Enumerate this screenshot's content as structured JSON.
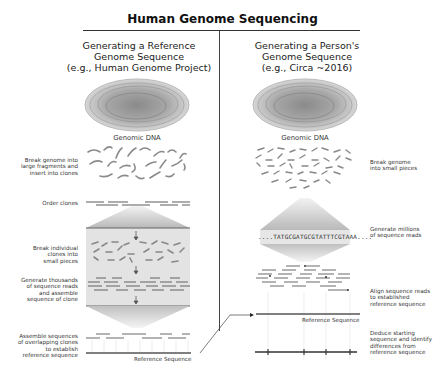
{
  "title": "Human Genome Sequencing",
  "left": {
    "heading": [
      "Generating a Reference",
      "Genome Sequence",
      "(e.g., Human Genome Project)"
    ],
    "dna_label": "Genomic DNA",
    "steps": [
      {
        "label": [
          "Break genome into",
          "large fragments and",
          "insert into clones"
        ]
      },
      {
        "label": [
          "Order clones"
        ]
      },
      {
        "label": [
          "Break individual",
          "clones into",
          "small pieces"
        ]
      },
      {
        "label": [
          "Generate thousands",
          "of sequence reads",
          "and assemble",
          "sequence of clone"
        ]
      },
      {
        "label": [
          "Assemble sequences",
          "of overlapping clones",
          "to establish",
          "reference sequence"
        ]
      }
    ],
    "reference_label": "Reference Sequence"
  },
  "right": {
    "heading": [
      "Generating a Person's",
      "Genome Sequence",
      "(e.g., Circa ~2016)"
    ],
    "dna_label": "Genomic DNA",
    "sequence_read": "....TATGCGATGCGTATTTCGTAAA....",
    "steps": [
      {
        "label": [
          "Break genome",
          "into small pieces"
        ]
      },
      {
        "label": [
          "Generate millions",
          "of sequence reads"
        ]
      },
      {
        "label": [
          "Align sequence reads",
          "to established",
          "reference sequence"
        ]
      },
      {
        "label": [
          "Deduce starting",
          "sequence and identify",
          "differences from",
          "reference sequence"
        ]
      }
    ],
    "reference_label": "Reference Sequence"
  },
  "colors": {
    "text": "#222222",
    "rule": "#333333",
    "gray_fill": "#c8c8c8",
    "fragment": "#8a8a8a"
  }
}
